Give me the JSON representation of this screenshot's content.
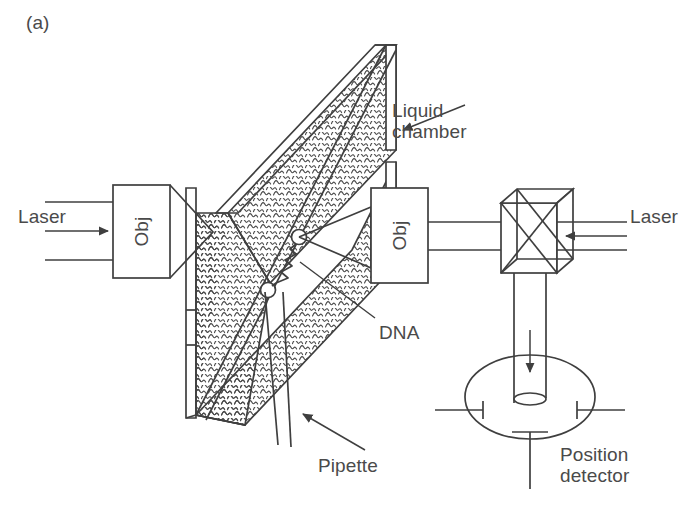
{
  "figure": {
    "panel_label": "(a)",
    "type": "optical-tweezers-apparatus-schematic",
    "background_color": "#ffffff",
    "line_color": "#3f3f3f",
    "text_color": "#4a4a4a"
  },
  "labels": {
    "laser_left": "Laser",
    "laser_right": "Laser",
    "liquid_chamber_line1": "Liquid",
    "liquid_chamber_line2": "chamber",
    "dna": "DNA",
    "pipette": "Pipette",
    "position_detector_line1": "Position",
    "position_detector_line2": "detector",
    "objective_left": "Obj",
    "objective_right": "Obj"
  },
  "components": [
    {
      "name": "laser-source-left",
      "label": "Laser",
      "side": "left"
    },
    {
      "name": "objective-left",
      "label": "Obj",
      "side": "left"
    },
    {
      "name": "liquid-chamber",
      "label": "Liquid chamber",
      "fill_pattern": "water-waves"
    },
    {
      "name": "dna-molecule",
      "label": "DNA",
      "beads": 2
    },
    {
      "name": "pipette",
      "label": "Pipette"
    },
    {
      "name": "objective-right",
      "label": "Obj",
      "side": "right"
    },
    {
      "name": "beam-splitter-cube",
      "label": ""
    },
    {
      "name": "laser-source-right",
      "label": "Laser",
      "side": "right"
    },
    {
      "name": "position-detector",
      "label": "Position detector",
      "quadrant_markers": 3
    }
  ],
  "beams": {
    "left_direction": "rightward",
    "right_direction": "leftward",
    "detector_direction": "downward"
  }
}
